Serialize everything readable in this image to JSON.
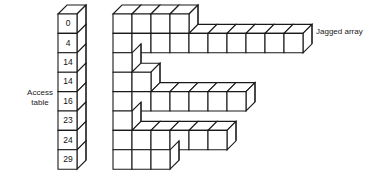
{
  "figure": {
    "labels": {
      "access_table_line1": "Access",
      "access_table_line2": "table",
      "jagged_array": "Jagged array"
    },
    "access_table": {
      "name": "access-table",
      "cell_count": 8,
      "values": [
        "0",
        "4",
        "14",
        "14",
        "16",
        "23",
        "24",
        "29"
      ]
    },
    "jagged_array": {
      "name": "jagged-array",
      "row_count": 8,
      "row_lengths": [
        4,
        10,
        1,
        2,
        7,
        1,
        6,
        3
      ],
      "note": "row lengths equal differences of consecutive access-table entries"
    },
    "colors": {
      "stroke": "#1a1a1a",
      "face": "#ffffff",
      "background": "#ffffff",
      "text": "#111111"
    },
    "geometry": {
      "cell_width": 19,
      "cell_height": 19,
      "depth_x": 9,
      "depth_y": -9
    }
  }
}
